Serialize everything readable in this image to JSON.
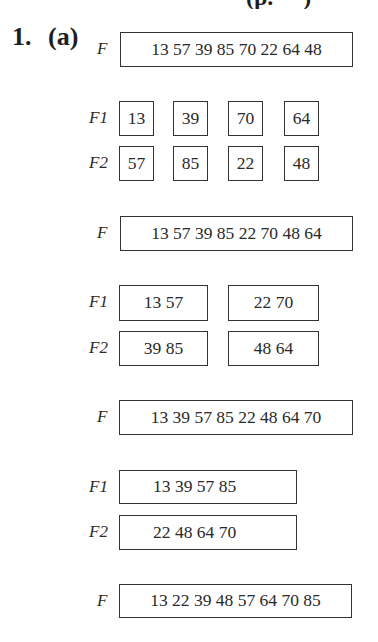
{
  "heading_fragment": "                (p.     )",
  "problem": {
    "number": "1.",
    "part": "(a)"
  },
  "steps": [
    {
      "type": "file",
      "label": "F",
      "records": "13 57 39 85 70 22 64 48"
    },
    {
      "type": "split",
      "files": [
        {
          "label": "F1",
          "runs": [
            "13",
            "39",
            "70",
            "64"
          ]
        },
        {
          "label": "F2",
          "runs": [
            "57",
            "85",
            "22",
            "48"
          ]
        }
      ]
    },
    {
      "type": "file",
      "label": "F",
      "records": "13 57 39 85 22 70 48 64"
    },
    {
      "type": "split",
      "files": [
        {
          "label": "F1",
          "runs": [
            "13 57",
            "22 70"
          ]
        },
        {
          "label": "F2",
          "runs": [
            "39 85",
            "48 64"
          ]
        }
      ]
    },
    {
      "type": "file",
      "label": "F",
      "records": "13 39 57 85 22 48 64 70"
    },
    {
      "type": "split",
      "files": [
        {
          "label": "F1",
          "runs": [
            "13 39 57 85"
          ]
        },
        {
          "label": "F2",
          "runs": [
            "22 48 64 70"
          ]
        }
      ]
    },
    {
      "type": "file",
      "label": "F",
      "records": "13 22 39 48 57 64 70 85"
    }
  ]
}
